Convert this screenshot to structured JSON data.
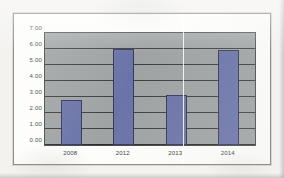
{
  "figure": {
    "border_color": "#8e8e8e",
    "page_background": "#f3f2ef",
    "artifact_name": "vertical-scan-fold-line"
  },
  "chart_data": {
    "type": "bar",
    "title": "",
    "subtitle": "",
    "xlabel": "",
    "ylabel": "",
    "categories": [
      "2008",
      "2012",
      "2013",
      "2014"
    ],
    "values": [
      2.8,
      6.0,
      3.1,
      5.95
    ],
    "series": [
      {
        "name": "",
        "values": [
          2.8,
          6.0,
          3.1,
          5.95
        ]
      }
    ],
    "ylim": [
      0.0,
      7.0
    ],
    "ytick_labels": [
      "7.00",
      "6.00",
      "5.00",
      "4.00",
      "3.00",
      "2.00",
      "1.00",
      "0.00"
    ],
    "ytick_values": [
      7.0,
      6.0,
      5.0,
      4.0,
      3.0,
      2.0,
      1.0,
      0.0
    ],
    "ytick_step": 1.0,
    "grid": true,
    "grid_axis": "y",
    "legend": false,
    "legend_position": "none",
    "bar_color": "#6b74a8",
    "bar_border_color": "#333a5c",
    "plot_background": "#9fa3a3",
    "gridline_color": "#3e3e3e",
    "annotations": []
  }
}
